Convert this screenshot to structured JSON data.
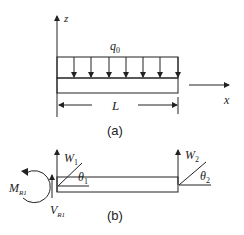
{
  "figure_a": {
    "caption": "(a)",
    "axis_z": "z",
    "axis_x": "x",
    "load_label": "q",
    "load_sub": "0",
    "length_label": "L",
    "load_arrow_count": 7
  },
  "figure_b": {
    "caption": "(b)",
    "w1": "W",
    "w1_sub": "1",
    "w2": "W",
    "w2_sub": "2",
    "theta1": "θ",
    "theta1_sub": "1",
    "theta2": "θ",
    "theta2_sub": "2",
    "moment": "M",
    "moment_sub": "R1",
    "shear": "V",
    "shear_sub": "R1"
  },
  "colors": {
    "stroke": "#222222",
    "background": "#ffffff"
  }
}
